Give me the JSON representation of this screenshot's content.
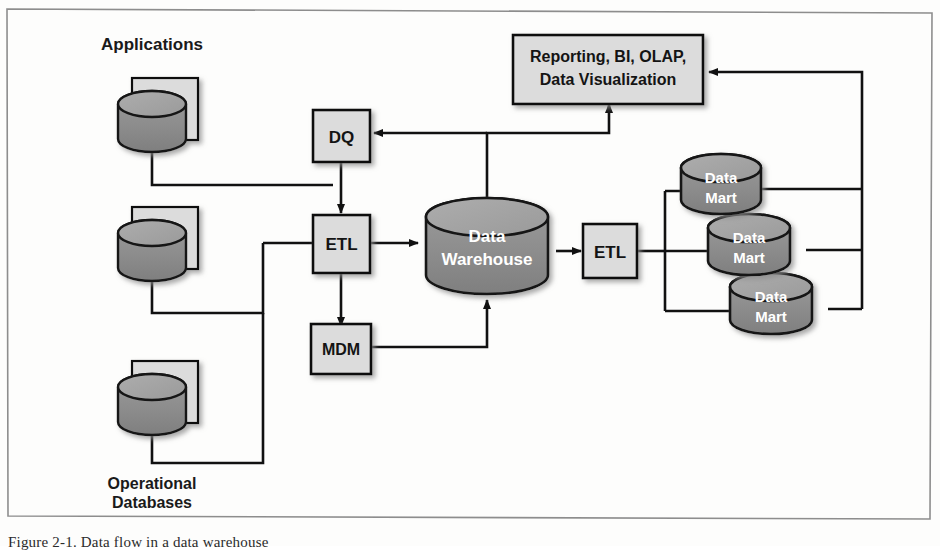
{
  "figure": {
    "caption": "Figure 2-1. Data flow in a data warehouse",
    "frame_color": "#8d8d8d",
    "background": "#fdfdfc"
  },
  "palette": {
    "box_fill": "#dcdcdc",
    "box_stroke": "#111111",
    "cylinder_top": "#a2a2a2",
    "cylinder_body": "#8d8d8d",
    "cylinder_stroke": "#141414",
    "line_color": "#111111",
    "text_dark": "#141414",
    "text_light": "#ffffff"
  },
  "sources": {
    "applications_label": "Applications",
    "operational_label_line1": "Operational",
    "operational_label_line2": "Databases",
    "icons": [
      {
        "name": "applications-source",
        "label": "Applications"
      },
      {
        "name": "database-source-middle",
        "label": ""
      },
      {
        "name": "database-source-bottom",
        "label": ""
      }
    ]
  },
  "nodes": {
    "dq": {
      "label": "DQ",
      "name": "dq-box"
    },
    "etl_left": {
      "label": "ETL",
      "name": "etl-left-box"
    },
    "mdm": {
      "label": "MDM",
      "name": "mdm-box"
    },
    "etl_right": {
      "label": "ETL",
      "name": "etl-right-box"
    },
    "warehouse": {
      "line1": "Data",
      "line2": "Warehouse",
      "name": "data-warehouse-cylinder"
    },
    "reporting": {
      "line1": "Reporting, BI, OLAP,",
      "line2": "Data Visualization",
      "name": "reporting-box"
    },
    "data_marts": [
      {
        "line1": "Data",
        "line2": "Mart",
        "name": "data-mart-1"
      },
      {
        "line1": "Data",
        "line2": "Mart",
        "name": "data-mart-2"
      },
      {
        "line1": "Data",
        "line2": "Mart",
        "name": "data-mart-3"
      }
    ]
  },
  "flows": [
    {
      "from": "Applications",
      "to": "ETL"
    },
    {
      "from": "Operational Databases",
      "to": "ETL"
    },
    {
      "from": "DQ",
      "to": "ETL"
    },
    {
      "from": "ETL",
      "to": "Data Warehouse"
    },
    {
      "from": "ETL",
      "to": "MDM"
    },
    {
      "from": "MDM",
      "to": "Data Warehouse"
    },
    {
      "from": "Data Warehouse",
      "to": "ETL (right)"
    },
    {
      "from": "Data Warehouse",
      "to": "Reporting, BI, OLAP, Data Visualization"
    },
    {
      "from": "Data Warehouse",
      "to": "DQ"
    },
    {
      "from": "ETL (right)",
      "to": "Data Mart 1"
    },
    {
      "from": "ETL (right)",
      "to": "Data Mart 2"
    },
    {
      "from": "ETL (right)",
      "to": "Data Mart 3"
    },
    {
      "from": "Data Marts",
      "to": "Reporting, BI, OLAP, Data Visualization"
    }
  ]
}
